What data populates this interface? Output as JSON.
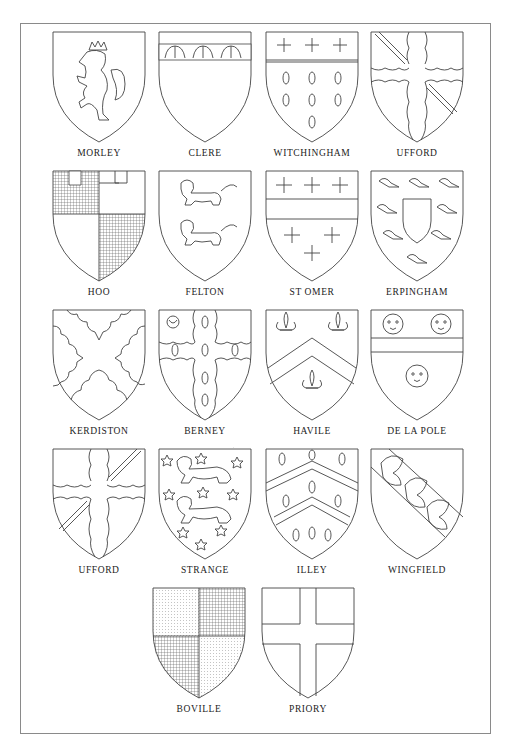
{
  "page": {
    "frame_color": "#8a8a8a",
    "ink_color": "#444444"
  },
  "shields": [
    {
      "name": "MORLEY",
      "charge": "lion rampant crowned"
    },
    {
      "name": "CLERE",
      "charge": "chief with eagles"
    },
    {
      "name": "WITCHINGHAM",
      "charge": "chief with crosses, ermine spots"
    },
    {
      "name": "UFFORD",
      "charge": "cross engrailed with bendlets"
    },
    {
      "name": "HOO",
      "charge": "quarterly, battlements"
    },
    {
      "name": "FELTON",
      "charge": "two lions passant"
    },
    {
      "name": "ST OMER",
      "charge": "fess between crosses crosslet"
    },
    {
      "name": "ERPINGHAM",
      "charge": "inescutcheon within orle of martlets"
    },
    {
      "name": "KERDISTON",
      "charge": "saltire engrailed"
    },
    {
      "name": "BERNEY",
      "charge": "cross engrailed ermine, crescent"
    },
    {
      "name": "HAVILE",
      "charge": "chevron between fleurs-de-lis"
    },
    {
      "name": "DE LA POLE",
      "charge": "fess between leopards' faces"
    },
    {
      "name": "UFFORD",
      "charge": "cross engrailed with bendlets"
    },
    {
      "name": "STRANGE",
      "charge": "two lions passant, semy of stars"
    },
    {
      "name": "ILLEY",
      "charge": "two chevrons between ermine spots"
    },
    {
      "name": "WINGFIELD",
      "charge": "bend with three wings"
    },
    {
      "name": "BOVILLE",
      "charge": "quarterly, dotted and checked"
    },
    {
      "name": "PRIORY",
      "charge": "plain cross"
    }
  ]
}
